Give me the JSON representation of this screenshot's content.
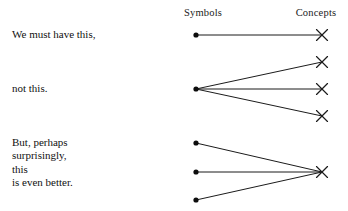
{
  "figure": {
    "title": "",
    "columns": {
      "left_label": "Symbols",
      "right_label": "Concepts"
    },
    "captions": {
      "row1": [
        "We must have this,"
      ],
      "row2": [
        "not this."
      ],
      "row3": [
        "But, perhaps",
        "surprisingly,",
        "this",
        "is even better."
      ]
    },
    "style": {
      "background": "#ffffff",
      "ink": "#1b1b1b",
      "dot_color": "#0d0d0d",
      "line_width": 1
    },
    "geometry": {
      "symbol_column_x": 196,
      "concept_column_x": 322,
      "dot_radius": 2.6,
      "x_arm": 5.5
    },
    "rows": [
      {
        "name": "one-to-one",
        "symbols": [
          {
            "x": 196,
            "y": 35
          }
        ],
        "concepts": [
          {
            "x": 322,
            "y": 35
          }
        ],
        "edges": [
          [
            0,
            0
          ]
        ]
      },
      {
        "name": "one-to-many",
        "symbols": [
          {
            "x": 196,
            "y": 89
          }
        ],
        "concepts": [
          {
            "x": 322,
            "y": 62
          },
          {
            "x": 322,
            "y": 89
          },
          {
            "x": 322,
            "y": 116
          }
        ],
        "edges": [
          [
            0,
            0
          ],
          [
            0,
            1
          ],
          [
            0,
            2
          ]
        ]
      },
      {
        "name": "many-to-one",
        "symbols": [
          {
            "x": 196,
            "y": 143
          },
          {
            "x": 196,
            "y": 172
          },
          {
            "x": 196,
            "y": 200
          }
        ],
        "concepts": [
          {
            "x": 322,
            "y": 172
          }
        ],
        "edges": [
          [
            0,
            0
          ],
          [
            1,
            0
          ],
          [
            2,
            0
          ]
        ]
      }
    ]
  }
}
